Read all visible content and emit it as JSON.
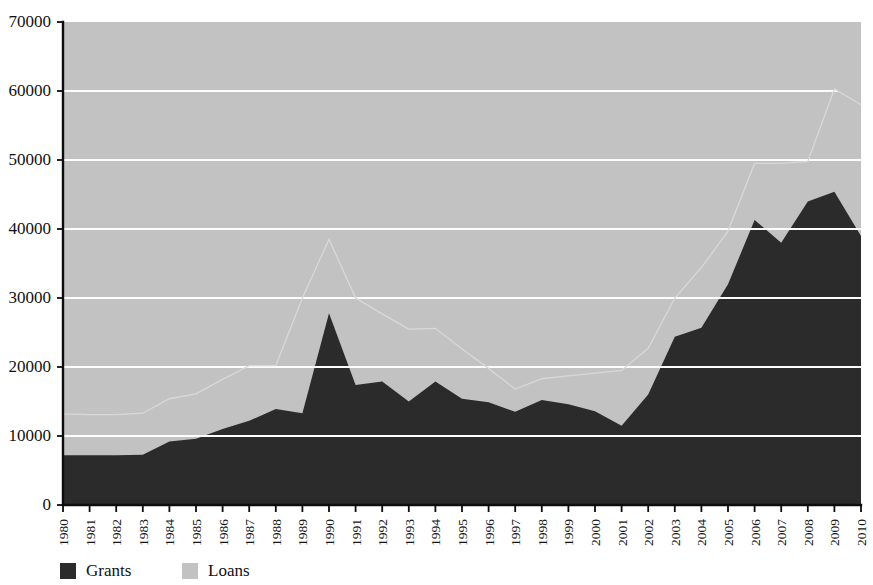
{
  "chart_data": {
    "type": "area",
    "stacked": true,
    "title": "",
    "xlabel": "",
    "ylabel": "",
    "ylim": [
      0,
      70000
    ],
    "xlim": [
      1980,
      2010
    ],
    "grid": true,
    "grid_color": "#fdfdfd",
    "legend_position": "bottom-left",
    "x": [
      1980,
      1981,
      1982,
      1983,
      1984,
      1985,
      1986,
      1987,
      1988,
      1989,
      1990,
      1991,
      1992,
      1993,
      1994,
      1995,
      1996,
      1997,
      1998,
      1999,
      2000,
      2001,
      2002,
      2003,
      2004,
      2005,
      2006,
      2007,
      2008,
      2009,
      2010
    ],
    "categories": [
      "1980",
      "1981",
      "1982",
      "1983",
      "1984",
      "1985",
      "1986",
      "1987",
      "1988",
      "1989",
      "1990",
      "1991",
      "1992",
      "1993",
      "1994",
      "1995",
      "1996",
      "1997",
      "1998",
      "1999",
      "2000",
      "2001",
      "2002",
      "2003",
      "2004",
      "2005",
      "2006",
      "2007",
      "2008",
      "2009",
      "2010"
    ],
    "series": [
      {
        "name": "Grants",
        "color": "#2b2b2b",
        "values": [
          7200,
          7200,
          7200,
          7300,
          9200,
          9600,
          11000,
          12200,
          13900,
          13300,
          27800,
          17400,
          17900,
          15000,
          17900,
          15400,
          14900,
          13500,
          15200,
          14600,
          13600,
          11500,
          16000,
          24400,
          25700,
          32000,
          41300,
          38000,
          44000,
          45400,
          39000
        ]
      },
      {
        "name": "Loans",
        "color": "#c2c2c2",
        "values": [
          6000,
          5900,
          5900,
          6000,
          6200,
          6500,
          7200,
          8000,
          6300,
          16700,
          10700,
          12600,
          9800,
          10500,
          7700,
          7200,
          4900,
          3300,
          3100,
          4100,
          5500,
          8000,
          6700,
          5600,
          8700,
          7700,
          8200,
          11500,
          5800,
          14900,
          19000
        ]
      }
    ],
    "totals": [
      13200,
      13100,
      13100,
      13300,
      15400,
      16100,
      18200,
      20200,
      20200,
      30000,
      38500,
      30000,
      27700,
      25500,
      25600,
      22600,
      19800,
      16800,
      18300,
      18700,
      19100,
      19500,
      22700,
      30000,
      34400,
      39700,
      49500,
      49500,
      49800,
      60300,
      58000
    ],
    "y_ticks": [
      0,
      10000,
      20000,
      30000,
      40000,
      50000,
      60000,
      70000
    ],
    "y_tick_labels": [
      "0",
      "10000",
      "20000",
      "30000",
      "40000",
      "50000",
      "60000",
      "70000"
    ]
  },
  "legend": {
    "items": [
      {
        "label": "Grants",
        "color": "#2b2b2b"
      },
      {
        "label": "Loans",
        "color": "#c2c2c2"
      }
    ]
  }
}
